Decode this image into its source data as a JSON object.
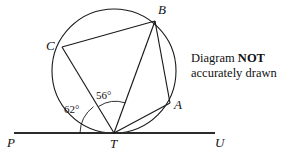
{
  "figure": {
    "type": "circle-geometry-diagram",
    "note": {
      "line1_prefix": "Diagram ",
      "line1_bold": "NOT",
      "line2": "accurately drawn"
    },
    "circle": {
      "center_x": 114,
      "center_y": 71,
      "radius": 62,
      "stroke": "#1a1a1a"
    },
    "points": {
      "A": {
        "label": "A",
        "x": 170,
        "y": 103,
        "label_x": 174,
        "label_y": 98
      },
      "B": {
        "label": "B",
        "x": 155,
        "y": 21,
        "label_x": 158,
        "label_y": 5
      },
      "C": {
        "label": "C",
        "x": 62,
        "y": 47,
        "label_x": 47,
        "label_y": 40
      },
      "T": {
        "label": "T",
        "x": 114,
        "y": 133,
        "label_x": 110,
        "label_y": 139
      },
      "P": {
        "label": "P",
        "x": 14,
        "y": 133,
        "label_x": 8,
        "label_y": 138
      },
      "U": {
        "label": "U",
        "x": 214,
        "y": 133,
        "label_x": 215,
        "label_y": 138
      }
    },
    "tangent_line": {
      "name": "PU",
      "x1": 14,
      "y1": 133,
      "x2": 215,
      "y2": 133
    },
    "segments": [
      {
        "name": "TC",
        "from": "T",
        "to": "C"
      },
      {
        "name": "TB",
        "from": "T",
        "to": "B"
      },
      {
        "name": "TA",
        "from": "T",
        "to": "A"
      },
      {
        "name": "CB",
        "from": "C",
        "to": "B"
      },
      {
        "name": "BA",
        "from": "B",
        "to": "A"
      }
    ],
    "angles": [
      {
        "name": "angle-PTC",
        "value": "62°",
        "between": [
          "TP",
          "TC"
        ],
        "label_x": 64,
        "label_y": 110
      },
      {
        "name": "angle-CTB",
        "value": "56°",
        "between": [
          "TC",
          "TB"
        ],
        "label_x": 96,
        "label_y": 96
      }
    ]
  }
}
